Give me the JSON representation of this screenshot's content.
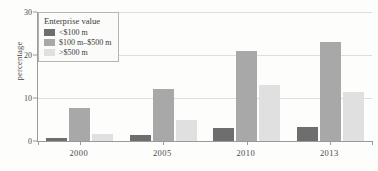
{
  "chart_data": {
    "type": "bar",
    "title": "",
    "xlabel": "",
    "ylabel": "percentage",
    "categories": [
      "2000",
      "2005",
      "2010",
      "2013"
    ],
    "ylim": [
      0,
      30
    ],
    "yticks": [
      0,
      10,
      20,
      30
    ],
    "ytick_labels": [
      "0",
      "10",
      "20",
      "30"
    ],
    "grid": true,
    "legend_position": "top-left",
    "legend_title": "Enterprise value",
    "series": [
      {
        "name": "<$100 m",
        "color": "#6e6e6e",
        "values": [
          0.7,
          1.5,
          3.0,
          3.2
        ]
      },
      {
        "name": "$100 m–$500 m",
        "color": "#a8a8a8",
        "values": [
          7.7,
          12.0,
          21.0,
          23.0
        ]
      },
      {
        "name": ">$500 m",
        "color": "#e0e0e0",
        "values": [
          1.7,
          5.0,
          13.0,
          11.3
        ]
      }
    ]
  },
  "axis": {
    "y_title": "percentage",
    "y_ticks": [
      "30",
      "20",
      "10",
      "0"
    ],
    "x_ticks": [
      "2000",
      "2005",
      "2010",
      "2013"
    ]
  },
  "legend": {
    "title": "Enterprise value",
    "items": [
      {
        "label": "<$100 m",
        "color": "#6e6e6e"
      },
      {
        "label": "$100 m–$500 m",
        "color": "#a8a8a8"
      },
      {
        "label": ">$500 m",
        "color": "#e0e0e0"
      }
    ]
  }
}
